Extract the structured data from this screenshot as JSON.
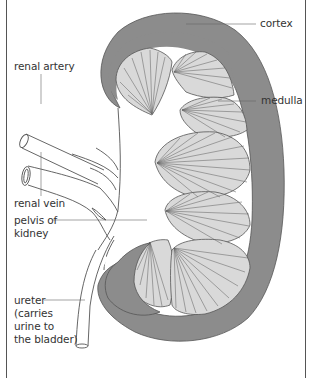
{
  "diagram": {
    "colors": {
      "cortex": "#8c8c8c",
      "medulla": "#d9d9d9",
      "outline": "#555555",
      "leader": "#666666",
      "background": "#ffffff"
    },
    "labels": {
      "cortex": "cortex",
      "medulla": "medulla",
      "renal_artery": "renal artery",
      "renal_vein": "renal vein",
      "pelvis": "pelvis of\nkidney",
      "ureter": "ureter\n(carries\nurine to\nthe bladder)"
    }
  }
}
